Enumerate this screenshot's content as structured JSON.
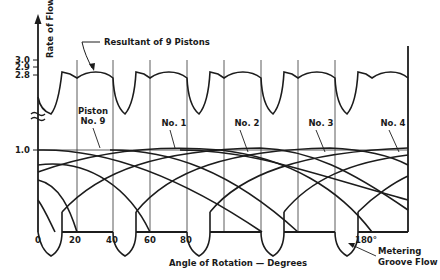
{
  "title": "Resultant of 9 Pistons",
  "axes": {
    "y_label": "Rate of Flow",
    "y_ticks": [
      "3.0",
      "2.9",
      "2.8",
      "1.0"
    ],
    "x_label": "Angle of Rotation — Degrees",
    "x_ticks": [
      "0",
      "20",
      "40",
      "60",
      "80",
      "180°"
    ]
  },
  "labels": {
    "resultant": "Resultant of 9 Pistons",
    "piston9_line1": "Piston",
    "piston9_line2": "No. 9",
    "no1": "No. 1",
    "no2": "No. 2",
    "no3": "No. 3",
    "no4": "No. 4",
    "metering_line1": "Metering",
    "metering_line2": "Groove Flow"
  },
  "colors": {
    "ink": "#1c1c1c",
    "background": "#ffffff"
  }
}
